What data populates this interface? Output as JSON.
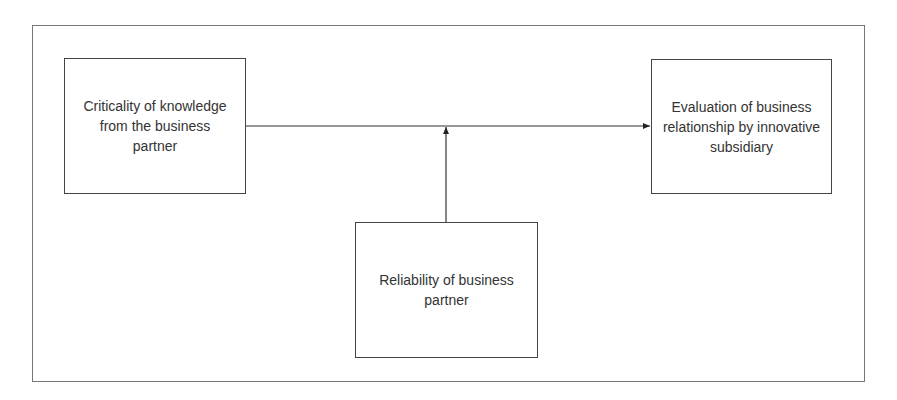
{
  "diagram": {
    "nodes": {
      "predictor": {
        "label": "Criticality of knowledge from the business partner"
      },
      "outcome": {
        "label": "Evaluation of business relationship by innovative subsidiary"
      },
      "moderator": {
        "label": "Reliability of business partner"
      }
    },
    "edges": [
      {
        "from": "predictor",
        "to": "outcome",
        "type": "arrow"
      },
      {
        "from": "moderator",
        "to": "predictor-outcome-edge",
        "type": "arrow"
      }
    ],
    "colors": {
      "stroke": "#444444",
      "frame": "#777777",
      "text": "#333333"
    }
  }
}
